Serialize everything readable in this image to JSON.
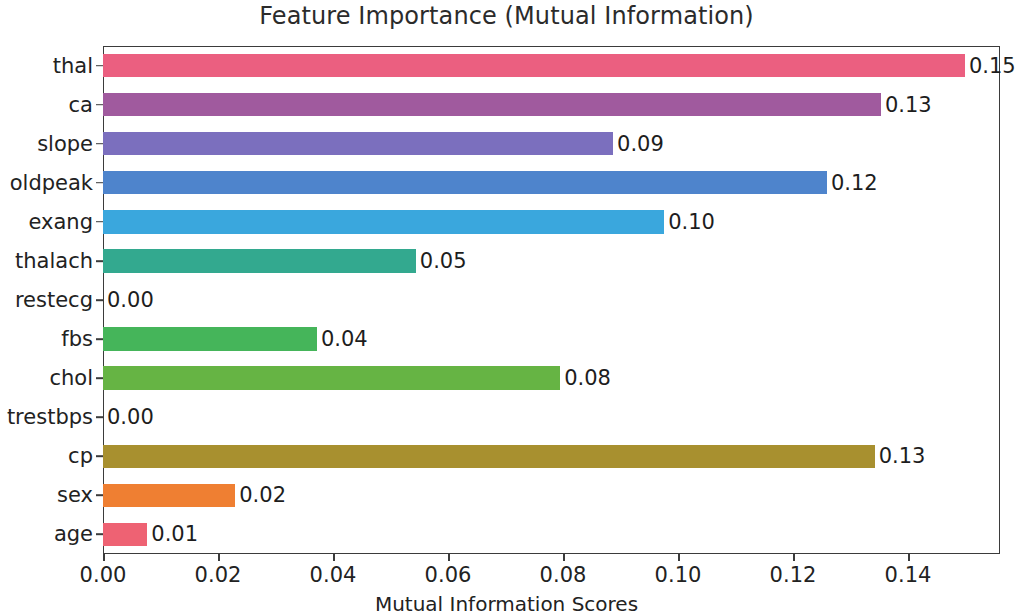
{
  "chart_data": {
    "type": "bar",
    "orientation": "horizontal",
    "title": "Feature Importance (Mutual Information)",
    "xlabel": "Mutual Information Scores",
    "ylabel": "",
    "categories": [
      "thal",
      "ca",
      "slope",
      "oldpeak",
      "exang",
      "thalach",
      "restecg",
      "fbs",
      "chol",
      "trestbps",
      "cp",
      "sex",
      "age"
    ],
    "values": [
      0.1499,
      0.1353,
      0.0887,
      0.1259,
      0.0976,
      0.0544,
      0.0,
      0.0372,
      0.0795,
      0.0,
      0.1342,
      0.023,
      0.0077
    ],
    "value_labels": [
      "0.15",
      "0.13",
      "0.09",
      "0.12",
      "0.10",
      "0.05",
      "0.00",
      "0.04",
      "0.08",
      "0.00",
      "0.13",
      "0.02",
      "0.01"
    ],
    "bar_colors": [
      "#eb5f80",
      "#a05a9e",
      "#7b6fbe",
      "#4e84cc",
      "#3aa7dd",
      "#33a98f",
      "#3aa85a",
      "#45b55a",
      "#66b444",
      "#8f9c33",
      "#a8902f",
      "#ef7f32",
      "#ee6273"
    ],
    "xlim": [
      0.0,
      0.156
    ],
    "xticks": [
      0.0,
      0.02,
      0.04,
      0.06,
      0.08,
      0.1,
      0.12,
      0.14
    ],
    "xtick_labels": [
      "0.00",
      "0.02",
      "0.04",
      "0.06",
      "0.08",
      "0.10",
      "0.12",
      "0.14"
    ],
    "grid": false,
    "legend": null
  },
  "figure": {
    "background": "#ffffff",
    "axis_color": "#3b3b3b",
    "text_color": "#222222"
  }
}
